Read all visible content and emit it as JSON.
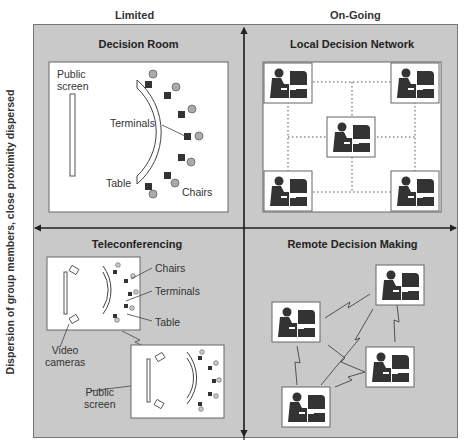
{
  "columns": {
    "left": "Limited",
    "right": "On-Going"
  },
  "y_axis_label": "Dispersion of group members, close proximity dispersed",
  "quadrants": {
    "top_left": {
      "title": "Decision Room",
      "labels": {
        "public_screen": "Public screen",
        "public_line1": "Public",
        "public_line2": "screen",
        "terminals": "Terminals",
        "table": "Table",
        "chairs": "Chairs"
      }
    },
    "top_right": {
      "title": "Local Decision Network",
      "workstations": 5
    },
    "bottom_left": {
      "title": "Teleconferencing",
      "labels": {
        "chairs": "Chairs",
        "terminals": "Terminals",
        "table": "Table",
        "video_line1": "Video",
        "video_line2": "cameras",
        "public_line1": "Public",
        "public_line2": "screen"
      }
    },
    "bottom_right": {
      "title": "Remote Decision Making",
      "workstations": 4
    }
  },
  "colors": {
    "background": "#ffffff",
    "quadrant_fill": "#c9c9c9",
    "panel_fill": "#ffffff",
    "ink": "#333333",
    "chair_fill": "#aaaaaa"
  }
}
